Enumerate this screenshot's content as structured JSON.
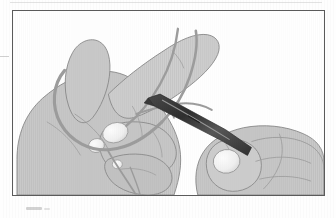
{
  "document": {
    "type": "scanned-illustration",
    "title": "Surgical knot tying — instrument tie",
    "caption": "",
    "page_background": "#fefefe"
  },
  "figure": {
    "name": "instrument-tie-illustration",
    "frame": {
      "border_color": "#5b5b5b",
      "border_width_px": 1.5,
      "x": 12,
      "y": 10,
      "width": 313,
      "height": 186,
      "fill": "#ffffff"
    },
    "palette": {
      "skin_fill": "#c9c9c9",
      "skin_fill_light": "#d4d4d4",
      "skin_shadow": "#b4b4b4",
      "outline": "#8a8a8a",
      "outline_dark": "#6f6f6f",
      "nail_fill": "#f2f2f2",
      "nail_outline": "#9a9a9a",
      "suture_thread": "#9a9a9a",
      "instrument_dark": "#3a3a3a",
      "instrument_mid": "#5e5e5e",
      "instrument_highlight": "#9d9d9d",
      "background": "#ffffff"
    },
    "objects": [
      {
        "name": "left-hand",
        "label": "Left hand holding suture loop",
        "description": "Open left hand seen from the back, thumb raised, index finger extended toward upper right"
      },
      {
        "name": "right-hand",
        "label": "Right hand holding instrument",
        "description": "Right hand gripping the needle holder shaft, thumb nail visible"
      },
      {
        "name": "needle-holder",
        "label": "Needle holder / hemostat",
        "description": "Dark tapered instrument running diagonally from upper-left to lower-right between the hands"
      },
      {
        "name": "suture-thread",
        "label": "Suture thread",
        "description": "Thin grey strand looped around left index finger and thumb, wrapped over the instrument tip"
      },
      {
        "name": "suture-tail",
        "label": "Suture tail",
        "description": "Free end of the thread hanging down past the left hand"
      }
    ],
    "fingernails": [
      {
        "name": "left-thumb-nail",
        "cx": 115,
        "cy": 133
      },
      {
        "name": "left-index-nail",
        "cx": 96,
        "cy": 145
      },
      {
        "name": "left-middle-nail",
        "cx": 113,
        "cy": 163
      },
      {
        "name": "right-thumb-nail",
        "cx": 224,
        "cy": 156
      }
    ]
  }
}
